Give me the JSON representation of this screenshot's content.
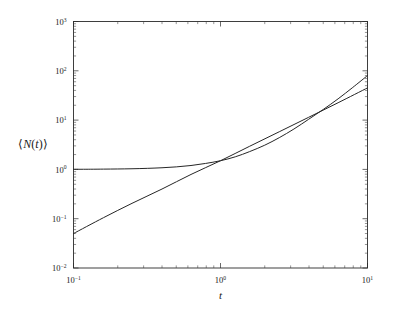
{
  "figure": {
    "background_color": "#ffffff",
    "ink_color": "#262626"
  },
  "axes": {
    "x_title": "t",
    "y_title_open": "⟨",
    "y_title_n": "N",
    "y_title_paren_open": "(",
    "y_title_t": "t",
    "y_title_paren_close": ")",
    "y_title_close": "⟩",
    "y_title_full": "⟨N(t)⟩",
    "x_tick_labels": [
      "10−1",
      "10⁰",
      "10¹"
    ],
    "y_tick_labels": [
      "10³",
      "10²",
      "10¹",
      "10⁰",
      "10−1",
      "10−2"
    ],
    "x_tick_base": "10",
    "x_tick_exponents": [
      "-1",
      "0",
      "1"
    ],
    "y_tick_base": "10",
    "y_tick_exponents": [
      "3",
      "2",
      "1",
      "0",
      "-1",
      "-2"
    ]
  },
  "chart_data": {
    "type": "line",
    "title": "",
    "xlabel": "t",
    "ylabel": "⟨N(t)⟩",
    "xscale": "log",
    "yscale": "log",
    "xlim": [
      0.1,
      10
    ],
    "ylim": [
      0.01,
      1000
    ],
    "grid": false,
    "legend": "none",
    "series": [
      {
        "name": "saturating-curve",
        "description": "Curve plateauing at 1 for small t, crossing over to power-law growth",
        "x": [
          0.1,
          0.13,
          0.16,
          0.2,
          0.25,
          0.32,
          0.4,
          0.5,
          0.63,
          0.79,
          1.0,
          1.26,
          1.58,
          2.0,
          2.51,
          3.16,
          3.98,
          5.01,
          6.31,
          7.94,
          10.0
        ],
        "y": [
          1.005,
          1.008,
          1.013,
          1.02,
          1.031,
          1.051,
          1.08,
          1.125,
          1.2,
          1.32,
          1.5,
          1.8,
          2.3,
          3.1,
          4.4,
          6.6,
          10.4,
          16.5,
          27.0,
          46.0,
          80.0
        ]
      },
      {
        "name": "power-law-line",
        "description": "Straight power law on log-log axes, slope approximately 2",
        "x": [
          0.1,
          0.16,
          0.25,
          0.4,
          0.63,
          1.0,
          1.58,
          2.51,
          3.98,
          6.31,
          10.0
        ],
        "y": [
          0.05,
          0.105,
          0.205,
          0.4,
          0.79,
          1.5,
          2.95,
          5.8,
          11.4,
          22.5,
          45.0
        ]
      }
    ],
    "note_power_law_exponent": 2.0,
    "note_plateau_value": 1.0,
    "note_left_line_value": 0.05,
    "note_right_merged_value": 500
  }
}
